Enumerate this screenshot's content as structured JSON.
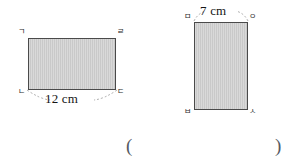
{
  "page": {
    "background_color": "#ffffff",
    "figure_fill_color": "#c9c9c9",
    "figure_border_color": "#4a4a4a"
  },
  "figures": [
    {
      "id": "left-rectangle",
      "shape": "rectangle",
      "vertices": [
        {
          "position": "top-left",
          "label": "ㄱ"
        },
        {
          "position": "top-right",
          "label": "ㄹ"
        },
        {
          "position": "bottom-left",
          "label": "ㄴ"
        },
        {
          "position": "bottom-right",
          "label": "ㄷ"
        }
      ],
      "dimension": {
        "label": "12 cm",
        "value": 12,
        "unit": "cm",
        "side": "bottom"
      }
    },
    {
      "id": "right-rectangle",
      "shape": "rectangle",
      "vertices": [
        {
          "position": "top-left",
          "label": "ㅁ"
        },
        {
          "position": "top-right",
          "label": "ㅇ"
        },
        {
          "position": "bottom-left",
          "label": "ㅂ"
        },
        {
          "position": "bottom-right",
          "label": "ㅅ"
        }
      ],
      "dimension": {
        "label": "7 cm",
        "value": 7,
        "unit": "cm",
        "side": "top"
      }
    }
  ],
  "answer_row": {
    "open_paren": "(",
    "close_paren": ")"
  }
}
